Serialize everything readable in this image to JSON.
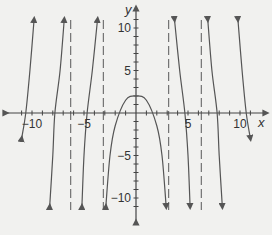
{
  "chart_data": {
    "type": "line",
    "title": "",
    "xlabel": "x",
    "ylabel": "y",
    "xlim": [
      -11.5,
      11.5
    ],
    "ylim": [
      -11.5,
      11.5
    ],
    "x_ticks": [
      -10,
      -5,
      5,
      10
    ],
    "y_ticks": [
      10,
      5,
      -5,
      -10
    ],
    "x_tick_labels": [
      "-10",
      "-5",
      "5",
      "10"
    ],
    "y_tick_labels": [
      "10",
      "5",
      "-5",
      "-10"
    ],
    "grid": false,
    "asymptotes_x": [
      -6.28,
      -3.14,
      3.14,
      6.28
    ],
    "series": [
      {
        "name": "branch-left-1",
        "x": [
          -11.0,
          -10.6,
          -10.2,
          -9.8
        ],
        "y": [
          -3,
          0,
          5,
          11
        ]
      },
      {
        "name": "branch-left-2",
        "x": [
          -8.3,
          -8.0,
          -7.8,
          -7.3,
          -6.9
        ],
        "y": [
          -11,
          -5,
          0,
          5,
          11
        ]
      },
      {
        "name": "branch-left-3",
        "x": [
          -5.2,
          -5.0,
          -4.7,
          -4.2,
          -3.7
        ],
        "y": [
          -11,
          -5,
          0,
          5,
          11
        ]
      },
      {
        "name": "branch-center",
        "x": [
          -2.9,
          -2.5,
          -2,
          -1,
          0,
          1,
          2,
          2.5,
          2.9
        ],
        "y": [
          -11,
          -5,
          -1.5,
          1.5,
          2,
          1.5,
          -1.5,
          -5,
          -11
        ]
      },
      {
        "name": "branch-right-1",
        "x": [
          3.7,
          4.2,
          4.7,
          5.0,
          5.2
        ],
        "y": [
          11,
          5,
          0,
          -5,
          -11
        ]
      },
      {
        "name": "branch-right-2",
        "x": [
          6.9,
          7.3,
          7.8,
          8.0,
          8.3
        ],
        "y": [
          11,
          5,
          0,
          -5,
          -11
        ]
      },
      {
        "name": "branch-right-3",
        "x": [
          9.8,
          10.2,
          10.6,
          11.0
        ],
        "y": [
          11,
          5,
          0,
          -3
        ]
      }
    ],
    "caption": "Figure"
  }
}
